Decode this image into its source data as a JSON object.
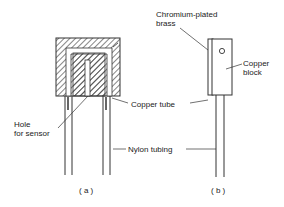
{
  "diagram": {
    "labels": {
      "chromium": [
        "Chromium-plated",
        "brass"
      ],
      "copper_block": [
        "Copper",
        "block"
      ],
      "copper_tube": "Copper tube",
      "hole": [
        "Hole",
        "for sensor"
      ],
      "nylon": "Nylon tubing",
      "panel_a": "( a )",
      "panel_b": "( b )"
    },
    "colors": {
      "line": "#333333",
      "background": "#ffffff"
    }
  }
}
